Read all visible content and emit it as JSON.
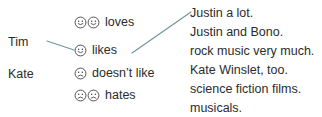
{
  "diagram": {
    "subjects": [
      {
        "label": "Tim"
      },
      {
        "label": "Kate"
      }
    ],
    "verbs": [
      {
        "label": "loves",
        "face": "smiling-face",
        "face_count": 2
      },
      {
        "label": "likes",
        "face": "smiling-face",
        "face_count": 1
      },
      {
        "label": "doesn’t like",
        "face": "frowning-face",
        "face_count": 1
      },
      {
        "label": "hates",
        "face": "frowning-face",
        "face_count": 2
      }
    ],
    "objects": [
      {
        "label": "Justin a lot."
      },
      {
        "label": "Justin and Bono."
      },
      {
        "label": "rock music very much."
      },
      {
        "label": "Kate Winslet, too."
      },
      {
        "label": "science fiction films."
      },
      {
        "label": "musicals."
      }
    ],
    "connectors": [
      {
        "name": "tim-to-likes",
        "from": "Tim",
        "to": "likes",
        "x1": 47,
        "y1": 41,
        "x2": 74,
        "y2": 50
      },
      {
        "name": "likes-to-justin",
        "from": "likes",
        "to": "Justin a lot.",
        "x1": 132,
        "y1": 53,
        "x2": 191,
        "y2": 12
      }
    ],
    "colors": {
      "text": "#2b2b2b",
      "connector": "#6e939b",
      "face_outline": "#3a3a3a",
      "background": "#ffffff"
    }
  }
}
